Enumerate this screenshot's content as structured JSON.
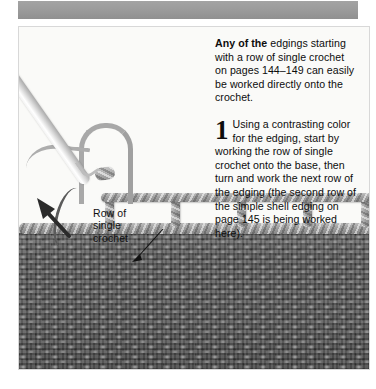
{
  "page": {
    "banner_color": "#9a9a9a",
    "panel_bg": "#fdfdfd",
    "yarn_color": "#9d9d9d",
    "fabric_color": "#5a5a5a"
  },
  "text_column": {
    "intro": {
      "lead_bold": "Any of the",
      "body": " edgings starting with a row of single crochet on pages 144–149 can easily be worked directly onto the crochet."
    },
    "step": {
      "number": "1",
      "body": "Using a contrasting color for the edging, start by working the row of single crochet onto the base, then turn and work the next row of the edging (the second row of the simple shell edging on page 145 is being worked here)."
    }
  },
  "annotations": [
    {
      "id": "row-of-single-crochet",
      "label": "Row of\nsingle\ncrochet"
    }
  ],
  "figure": {
    "tool_label": "crochet-hook",
    "mesh_label": "edging-mesh-row",
    "fabric_label": "crochet-fabric",
    "arrow_label": "direction-arrow"
  }
}
